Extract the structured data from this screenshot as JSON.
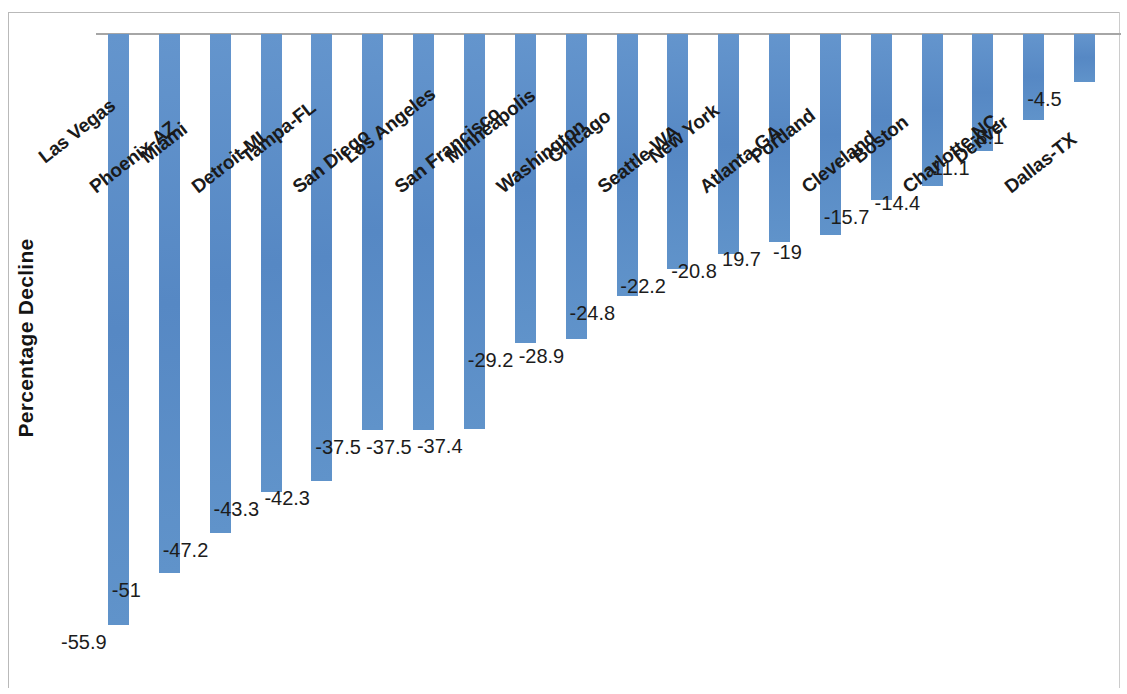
{
  "chart_data": {
    "type": "bar",
    "title": "",
    "xlabel": "",
    "ylabel": "Percentage Decline",
    "ylim": [
      -60,
      0
    ],
    "grid": false,
    "legend": "none",
    "orientation": "vertical-downward",
    "categories": [
      "Las Vegas",
      "Phoenix-AZ",
      "Miami",
      "Detroit-MI",
      "Tampa-FL",
      "San Diego",
      "Los Angeles",
      "San Francisco",
      "Minneapolis",
      "Washington",
      "Chicago",
      "Seattle-WA",
      "New York",
      "Atlanta-GA",
      "Portland",
      "Cleveland",
      "Boston",
      "Charlotte-NC",
      "Denver",
      "Dallas-TX"
    ],
    "values": [
      -55.9,
      -51,
      -47.2,
      -43.3,
      -42.3,
      -37.5,
      -37.5,
      -37.4,
      -29.2,
      -28.9,
      -24.8,
      -22.2,
      -20.8,
      -19.7,
      -19,
      -15.7,
      -14.4,
      -11.1,
      -8.1,
      -4.5
    ],
    "value_labels": [
      "-55.9",
      "-51",
      "-47.2",
      "-43.3",
      "-42.3",
      "-37.5",
      "-37.5",
      "-37.4",
      "-29.2",
      "-28.9",
      "-24.8",
      "-22.2",
      "-20.8",
      "19.7",
      "-19",
      "-15.7",
      "-14.4",
      "-11.1",
      "8.1",
      "-4.5"
    ],
    "series_color": "#5c8fc9"
  },
  "axis": {
    "y_title": "Percentage Decline"
  }
}
